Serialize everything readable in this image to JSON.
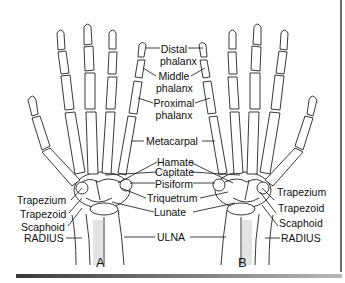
{
  "figure": {
    "panels": [
      {
        "id": "A",
        "label": "A"
      },
      {
        "id": "B",
        "label": "B"
      }
    ],
    "center_labels": {
      "distal_line1": "Distal",
      "distal_line2": "phalanx",
      "middle_line1": "Middle",
      "middle_line2": "phalanx",
      "proximal_line1": "Proximal",
      "proximal_line2": "phalanx",
      "metacarpal": "Metacarpal",
      "hamate": "Hamate",
      "capitate": "Capitate",
      "pisiform": "Pisiform",
      "triquetrum": "Triquetrum",
      "lunate": "Lunate",
      "ulna": "ULNA"
    },
    "left_labels": {
      "trapezium": "Trapezium",
      "trapezoid": "Trapezoid",
      "scaphoid": "Scaphoid",
      "radius": "RADIUS"
    },
    "right_labels": {
      "trapezium": "Trapezium",
      "trapezoid": "Trapezoid",
      "scaphoid": "Scaphoid",
      "radius": "RADIUS"
    },
    "colors": {
      "bone_fill": "#ffffff",
      "bone_outline": "#222222",
      "shading": "#cfcfcf",
      "text": "#111111"
    }
  }
}
